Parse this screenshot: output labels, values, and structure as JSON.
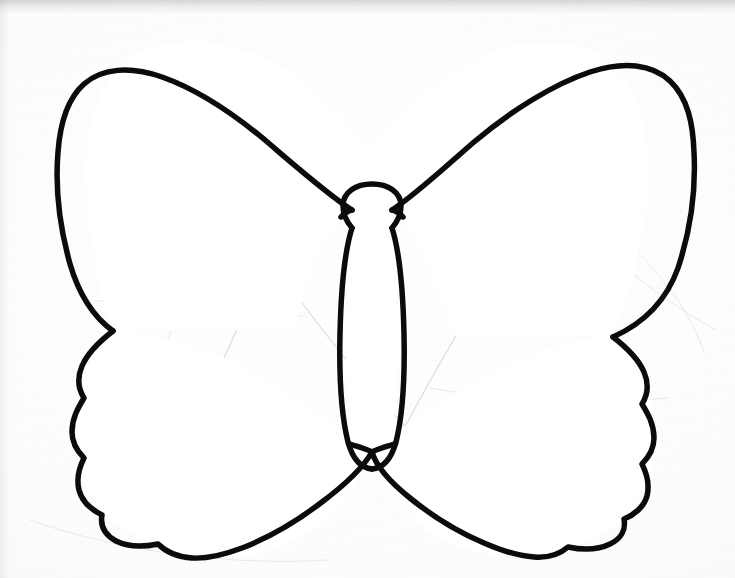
{
  "document": {
    "title": "Butterfly Outline Template",
    "subject": "butterfly",
    "medium": "black ink line drawing on white paper",
    "style": "coloring page / craft template outline",
    "background_color": "#fbfbfa",
    "ink_color": "#0b0b0b",
    "pencil_guide_color": "#b9b6bd",
    "canvas": {
      "width": 735,
      "height": 578
    },
    "visible_text": "",
    "has_text": false
  },
  "artwork": {
    "name": "butterfly-outline",
    "symmetry": "bilateral vertical about x = 372",
    "stroke_width_px": 5.5,
    "parts": [
      {
        "name": "head",
        "shape": "circle",
        "cx": 372,
        "cy": 206,
        "r": 21
      },
      {
        "name": "abdomen",
        "shape": "elongated-oval",
        "cx": 372,
        "top_y": 226,
        "bottom_y": 468,
        "max_width": 52
      },
      {
        "name": "upper-left-wing",
        "shape": "large-teardrop",
        "tip_x": 48,
        "top_y": 42,
        "notch_x": 113,
        "notch_y": 330
      },
      {
        "name": "upper-right-wing",
        "shape": "large-teardrop",
        "tip_x": 692,
        "top_y": 42,
        "notch_x": 612,
        "notch_y": 336
      },
      {
        "name": "lower-left-wing",
        "shape": "scalloped-lobe",
        "left_x": 72,
        "bottom_y": 558,
        "scallop_count": 5
      },
      {
        "name": "lower-right-wing",
        "shape": "scalloped-lobe",
        "right_x": 665,
        "bottom_y": 556,
        "scallop_count": 5
      }
    ],
    "pencil_guides_visible": true,
    "pencil_guide_count": 9
  },
  "chart_data": {
    "type": "line",
    "title": "Butterfly outline template",
    "xlabel": "",
    "ylabel": "",
    "note": "Not a data chart — hand-drawn butterfly silhouette outline."
  }
}
